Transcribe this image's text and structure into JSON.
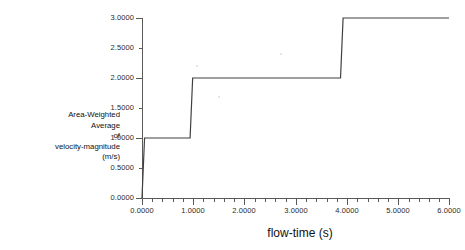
{
  "page": {
    "background": "#ffffff",
    "clipped_top_text": " "
  },
  "chart_data": {
    "type": "line",
    "title": "",
    "xlabel": "flow-time (s)",
    "ylabel": "Area-Weighted Average of velocity-magnitude (m/s)",
    "ylabel_lines": [
      "Area-Weighted",
      "Average",
      "of",
      "velocity-magnitude",
      "(m/s)"
    ],
    "xlim": [
      0.0,
      6.0
    ],
    "ylim": [
      0.0,
      3.0
    ],
    "grid": false,
    "legend": null,
    "line_color": "#404040",
    "xticks": [
      0.0,
      1.0,
      2.0,
      3.0,
      4.0,
      5.0,
      6.0
    ],
    "xtick_labels": [
      "0.0000",
      "1.0000",
      "2.0000",
      "3.0000",
      "4.0000",
      "5.0000",
      "6.0000"
    ],
    "yticks": [
      0.0,
      0.5,
      1.0,
      1.5,
      2.0,
      2.5,
      3.0
    ],
    "ytick_labels": [
      "0.0000",
      "0.5000",
      "1.0000",
      "1.5000",
      "2.0000",
      "2.5000",
      "3.0000"
    ],
    "x_minor_per_major": 5,
    "y_minor_per_major": 2,
    "series": [
      {
        "name": "Area-Weighted Average of velocity-magnitude",
        "x": [
          0.0,
          0.05,
          0.94,
          0.99,
          3.88,
          3.93,
          6.0
        ],
        "y": [
          0.0,
          1.0,
          1.0,
          2.0,
          2.0,
          3.0,
          3.0
        ]
      }
    ]
  }
}
